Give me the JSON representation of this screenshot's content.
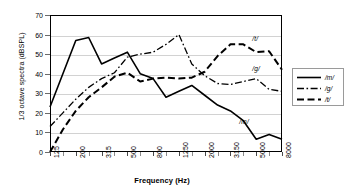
{
  "chart_data": {
    "type": "line",
    "title": "",
    "xlabel": "Frequency (Hz)",
    "ylabel": "1/3 octave spectra (dBSPL)",
    "ylim": [
      0,
      70
    ],
    "ytick_step": 10,
    "yticks": [
      0,
      10,
      20,
      30,
      40,
      50,
      60,
      70
    ],
    "grid": true,
    "legend_position": "right-outside",
    "x": [
      125,
      160,
      200,
      250,
      315,
      400,
      500,
      630,
      800,
      1000,
      1250,
      1600,
      2000,
      2500,
      3150,
      4000,
      5000,
      6300,
      8000
    ],
    "xtick_labels": [
      "125",
      "200",
      "315",
      "500",
      "800",
      "1250",
      "2000",
      "3150",
      "5000",
      "8000"
    ],
    "xtick_indices": [
      0,
      2,
      4,
      6,
      8,
      10,
      12,
      14,
      16,
      18
    ],
    "series": [
      {
        "name": "/m/",
        "style": "solid",
        "color": "#000000",
        "values": [
          23,
          40,
          57,
          58.5,
          45,
          48,
          51,
          40,
          37.5,
          28,
          31,
          34,
          29,
          24,
          21,
          16,
          6.5,
          9,
          6.5
        ]
      },
      {
        "name": "/g/",
        "style": "dash-dot",
        "color": "#000000",
        "values": [
          13,
          20,
          27,
          33,
          37.5,
          40.5,
          48.5,
          50,
          51,
          55,
          60,
          45,
          39,
          35,
          34.5,
          36,
          37.5,
          32,
          31
        ]
      },
      {
        "name": "/t/",
        "style": "dashed",
        "color": "#000000",
        "values": [
          0,
          11.5,
          21,
          28,
          33,
          38.5,
          40.5,
          36,
          37.5,
          38,
          37.5,
          38,
          41,
          49,
          55,
          55,
          51,
          51.5,
          42
        ]
      }
    ],
    "annotations": [
      {
        "text": "/t/",
        "x_index": 16,
        "value": 55
      },
      {
        "text": "/g/",
        "x_index": 16,
        "value": 40
      },
      {
        "text": "/m/",
        "x_index": 15,
        "value": 13
      }
    ]
  },
  "legend": {
    "items": [
      {
        "label": "/m/",
        "style": "solid"
      },
      {
        "label": "/g/",
        "style": "dash-dot"
      },
      {
        "label": "/t/",
        "style": "dashed"
      }
    ]
  }
}
